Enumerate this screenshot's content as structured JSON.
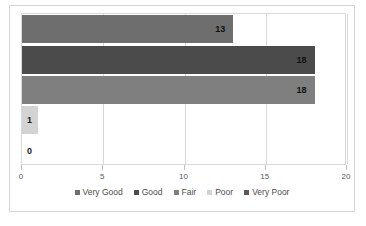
{
  "chart_data": {
    "type": "bar",
    "orientation": "horizontal",
    "title": "",
    "xlabel": "",
    "ylabel": "",
    "categories": [
      "Very Good",
      "Good",
      "Fair",
      "Poor",
      "Very Poor"
    ],
    "values": [
      13,
      18,
      18,
      1,
      0
    ],
    "data_labels": [
      "13",
      "18",
      "18",
      "1",
      "0"
    ],
    "colors": [
      "#6e6e6e",
      "#4b4b4b",
      "#7f7f7f",
      "#d3d3d3",
      "#595959"
    ],
    "xlim": [
      0,
      20
    ],
    "xticks": [
      0,
      5,
      10,
      15,
      20
    ],
    "xtick_labels": [
      "0",
      "5",
      "10",
      "15",
      "20"
    ],
    "grid": true,
    "grid_axis": "x",
    "legend_position": "bottom",
    "legend": [
      {
        "label": "Very Good",
        "color": "#6e6e6e"
      },
      {
        "label": "Good",
        "color": "#4b4b4b"
      },
      {
        "label": "Fair",
        "color": "#7f7f7f"
      },
      {
        "label": "Poor",
        "color": "#d3d3d3"
      },
      {
        "label": "Very Poor",
        "color": "#595959"
      }
    ]
  }
}
